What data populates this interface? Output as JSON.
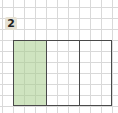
{
  "problem": {
    "number": "2"
  },
  "diagram": {
    "type": "fraction-rectangle",
    "total_parts": 3,
    "shaded_parts": 1,
    "shaded_indices": [
      0
    ],
    "colors": {
      "shaded": "#a8ce8c",
      "outline": "#4a4a4a",
      "grid": "#d9d9d9",
      "label_bg": "#e6e1d3"
    }
  }
}
